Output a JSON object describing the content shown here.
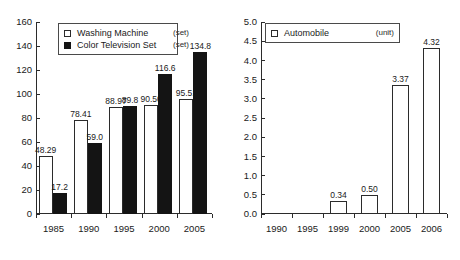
{
  "chart_data": [
    {
      "type": "bar",
      "title": "",
      "xlabel": "",
      "ylabel": "",
      "ylim": [
        0,
        160
      ],
      "yticks": [
        "0",
        "20",
        "40",
        "60",
        "80",
        "100",
        "120",
        "140",
        "160"
      ],
      "grid": false,
      "legend_position": "top-left-inside",
      "categories": [
        "1985",
        "1990",
        "1995",
        "2000",
        "2005"
      ],
      "series": [
        {
          "name": "Washing Machine",
          "unit": "(set)",
          "color": "#ffffff",
          "values": [
            48.29,
            78.41,
            88.97,
            90.5,
            95.51
          ],
          "labels": [
            "48.29",
            "78.41",
            "88.97",
            "90.50",
            "95.51"
          ]
        },
        {
          "name": "Color Television Set",
          "unit": "(set)",
          "color": "#141414",
          "values": [
            17.2,
            59.0,
            89.8,
            116.6,
            134.8
          ],
          "labels": [
            "17.2",
            "59.0",
            "89.8",
            "116.6",
            "134.8"
          ]
        }
      ]
    },
    {
      "type": "bar",
      "title": "",
      "xlabel": "",
      "ylabel": "",
      "ylim": [
        0,
        5.0
      ],
      "yticks": [
        "0.0",
        "0.5",
        "1.0",
        "1.5",
        "2.0",
        "2.5",
        "3.0",
        "3.5",
        "4.0",
        "4.5",
        "5.0"
      ],
      "grid": false,
      "legend_position": "top-left-inside",
      "categories": [
        "1990",
        "1995",
        "1999",
        "2000",
        "2005",
        "2006"
      ],
      "series": [
        {
          "name": "Automobile",
          "unit": "(unit)",
          "color": "#ffffff",
          "values": [
            0,
            0,
            0.34,
            0.5,
            3.37,
            4.32
          ],
          "labels": [
            "",
            "",
            "0.34",
            "0.50",
            "3.37",
            "4.32"
          ]
        }
      ]
    }
  ]
}
